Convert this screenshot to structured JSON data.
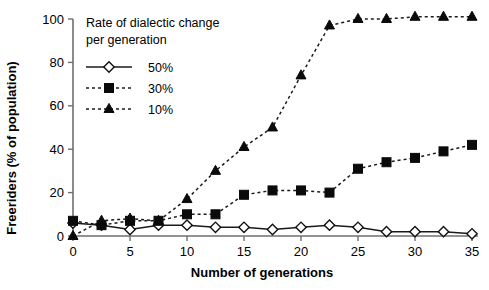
{
  "chart_data": {
    "type": "line",
    "title": "",
    "xlabel": "Number of generations",
    "ylabel": "Freeriders (% of population)",
    "legend_title_line1": "Rate of dialectic change",
    "legend_title_line2": "per generation",
    "legend_position": "top-left-inside",
    "grid": false,
    "xlim": [
      0,
      35
    ],
    "ylim": [
      0,
      100
    ],
    "xticks": [
      0,
      5,
      10,
      15,
      20,
      25,
      30,
      35
    ],
    "xtick_labels": [
      "0",
      "5",
      "10",
      "15",
      "20",
      "25",
      "30",
      "35"
    ],
    "yticks": [
      0,
      20,
      40,
      60,
      80,
      100
    ],
    "ytick_labels": [
      "0",
      "20",
      "40",
      "60",
      "80",
      "100"
    ],
    "x": [
      0,
      2.5,
      5,
      7.5,
      10,
      12.5,
      15,
      17.5,
      20,
      22.5,
      25,
      27.5,
      30,
      32.5,
      35
    ],
    "series": [
      {
        "name": "50%",
        "marker": "open-diamond",
        "line": "solid",
        "color": "#111111",
        "values": [
          6,
          5,
          3,
          5,
          5,
          4,
          4,
          3,
          4,
          5,
          4,
          2,
          2,
          2,
          1
        ]
      },
      {
        "name": "30%",
        "marker": "filled-square",
        "line": "dashed",
        "color": "#0a0a0a",
        "values": [
          7,
          5,
          7,
          7,
          10,
          10,
          19,
          21,
          21,
          20,
          31,
          34,
          36,
          39,
          42
        ]
      },
      {
        "name": "10%",
        "marker": "filled-triangle",
        "line": "dashed",
        "color": "#0a0a0a",
        "values": [
          0,
          7,
          8,
          7,
          17,
          30,
          41,
          50,
          74,
          97,
          100,
          100,
          101,
          101,
          101
        ]
      }
    ]
  }
}
